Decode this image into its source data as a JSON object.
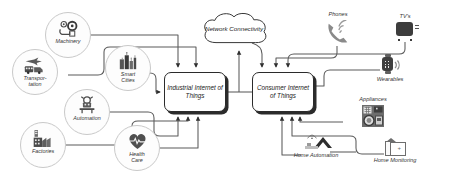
{
  "diagram": {
    "background_color": "#ffffff",
    "line_color": "#5a5a5a"
  },
  "central_nodes": [
    {
      "id": "iiot",
      "label": "Industrial Internet of Things",
      "shape": "rounded-box"
    },
    {
      "id": "ciot",
      "label": "Consumer Internet of Things",
      "shape": "rounded-box"
    }
  ],
  "cloud": {
    "label": "Network Connectivity",
    "shape": "cloud"
  },
  "industrial_sources": [
    {
      "id": "machinery",
      "label": "Machinery",
      "icon": "gears-icon"
    },
    {
      "id": "transportation",
      "label": "Transpor- tation",
      "label_line1": "Transpor-",
      "label_line2": "tation",
      "icon": "transport-icon"
    },
    {
      "id": "smart-cities",
      "label": "Smart Cities",
      "label_line1": "Smart",
      "label_line2": "Cities",
      "icon": "city-icon"
    },
    {
      "id": "automation",
      "label": "Automation",
      "icon": "robot-arm-icon"
    },
    {
      "id": "factories",
      "label": "Factories",
      "icon": "factory-icon"
    },
    {
      "id": "health-care",
      "label": "Health Care",
      "label_line1": "Health",
      "label_line2": "Care",
      "icon": "heart-pulse-icon"
    }
  ],
  "consumer_devices": [
    {
      "id": "phones",
      "label": "Phones",
      "icon": "phone-signal-icon"
    },
    {
      "id": "tvs",
      "label": "TV's",
      "icon": "television-icon"
    },
    {
      "id": "wearables",
      "label": "Wearables",
      "icon": "smartwatch-icon"
    },
    {
      "id": "appliances",
      "label": "Appliances",
      "icon": "appliance-icon"
    },
    {
      "id": "home-automation",
      "label": "Home Automation",
      "icon": "home-automation-icon"
    },
    {
      "id": "home-monitoring",
      "label": "Home Monitoring",
      "icon": "home-monitoring-icon"
    }
  ]
}
